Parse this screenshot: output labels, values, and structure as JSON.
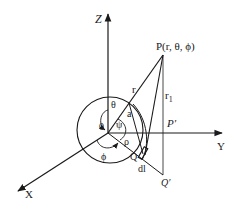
{
  "diagram": {
    "type": "3D spherical coordinate geometry",
    "axes": {
      "z_label": "Z",
      "y_label": "Y",
      "x_label": "X"
    },
    "points": {
      "origin_label": "0",
      "p_label": "P(r, θ, ϕ)",
      "p_prime_label": "P′",
      "q_label": "Q",
      "q_prime_label": "Q′"
    },
    "quantities": {
      "r_label": "r",
      "r1_label": "r",
      "r1_subscript": "1",
      "theta_label": "θ",
      "a_label": "a",
      "psi_label": "ψ",
      "rho_label": "ρ",
      "phi_label": "ϕ",
      "dl_label": "dl"
    },
    "colors": {
      "line": "#1a1a1a",
      "background": "#ffffff"
    }
  }
}
